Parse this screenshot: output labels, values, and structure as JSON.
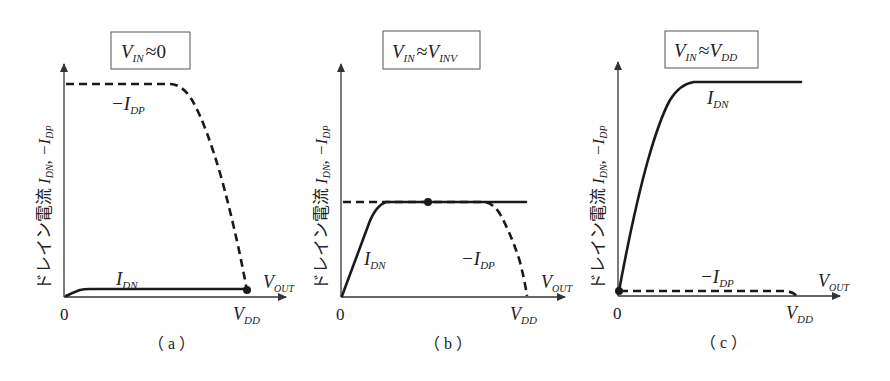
{
  "figure": {
    "y_axis_label_jp": "ドレイン電流 ",
    "y_axis_label_math": "I_DN, −I_DP",
    "x_axis_label": "V_OUT",
    "origin_label": "0",
    "vdd_label": "V_DD"
  },
  "panels": [
    {
      "id": "a",
      "caption": "( a )",
      "condition": "V_IN ≈ 0",
      "condition_parts": {
        "main": "V",
        "sub": "IN",
        "approx": "≈",
        "rhs_main": "0",
        "rhs_sub": ""
      },
      "curves": [
        {
          "name": "−I_DP",
          "style": "dashed",
          "description": "flat at maximum then falls to zero at V_DD"
        },
        {
          "name": "I_DN",
          "style": "solid",
          "description": "very small, nearly flat near zero"
        }
      ],
      "operating_point": "V_OUT ≈ V_DD"
    },
    {
      "id": "b",
      "caption": "( b )",
      "condition": "V_IN ≈ V_INV",
      "condition_parts": {
        "main": "V",
        "sub": "IN",
        "approx": "≈",
        "rhs_main": "V",
        "rhs_sub": "INV"
      },
      "curves": [
        {
          "name": "I_DN",
          "style": "solid",
          "description": "rises linearly then saturates at mid level"
        },
        {
          "name": "−I_DP",
          "style": "dashed",
          "description": "flat at mid level then falls to zero at V_DD"
        }
      ],
      "operating_point": "V_OUT mid-range (≈ V_DD/2)"
    },
    {
      "id": "c",
      "caption": "( c )",
      "condition": "V_IN ≈ V_DD",
      "condition_parts": {
        "main": "V",
        "sub": "IN",
        "approx": "≈",
        "rhs_main": "V",
        "rhs_sub": "DD"
      },
      "curves": [
        {
          "name": "I_DN",
          "style": "solid",
          "description": "rises steeply then saturates at maximum"
        },
        {
          "name": "−I_DP",
          "style": "dashed",
          "description": "very small, nearly flat near zero"
        }
      ],
      "operating_point": "V_OUT ≈ 0"
    }
  ],
  "labels": {
    "idn_main": "I",
    "idn_sub": "DN",
    "idp_main": "−I",
    "idp_sub": "DP",
    "vout_main": "V",
    "vout_sub": "OUT",
    "vdd_main": "V",
    "vdd_sub": "DD",
    "ylabel_jp": "ドレイン電流",
    "ylabel_i1": "I",
    "ylabel_s1": "DN",
    "ylabel_sep": ", ",
    "ylabel_i2": "−I",
    "ylabel_s2": "DP",
    "zero": "0",
    "cap_a": "（ a ）",
    "cap_b": "（ b ）",
    "cap_c": "（ c ）",
    "cond_v": "V",
    "cond_in": "IN",
    "cond_approx": "≈",
    "cond_a_rhs": "0",
    "cond_b_rhs_sub": "INV",
    "cond_c_rhs_sub": "DD"
  },
  "colors": {
    "line": "#1a1a1a",
    "axis": "#333333",
    "box_border": "#555555",
    "background": "#ffffff"
  }
}
